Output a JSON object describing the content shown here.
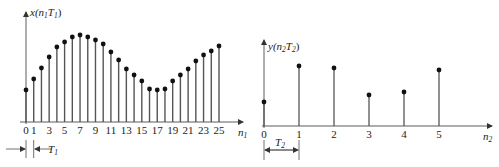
{
  "chart_data": [
    {
      "type": "stem",
      "title": "",
      "ylabel": "x(n1T1)",
      "ylabel_parts": {
        "fn": "x(",
        "var": "n",
        "var_sub": "1",
        "T": "T",
        "T_sub": "1",
        "close": ")"
      },
      "xlabel": "n1",
      "xlabel_parts": {
        "var": "n",
        "sub": "1"
      },
      "x": [
        0,
        1,
        2,
        3,
        4,
        5,
        6,
        7,
        8,
        9,
        10,
        11,
        12,
        13,
        14,
        15,
        16,
        17,
        18,
        19,
        20,
        21,
        22,
        23,
        24,
        25
      ],
      "tick_labels": [
        "0",
        "1",
        "3",
        "5",
        "7",
        "9",
        "11",
        "13",
        "15",
        "17",
        "19",
        "21",
        "23",
        "25"
      ],
      "tick_positions": [
        0,
        1,
        3,
        5,
        7,
        9,
        11,
        13,
        15,
        17,
        19,
        21,
        23,
        25
      ],
      "values_px": [
        32,
        43,
        54,
        65,
        75,
        80,
        85,
        87,
        85,
        82,
        78,
        70,
        62,
        53,
        47,
        41,
        33,
        32,
        33,
        41,
        47,
        53,
        61,
        67,
        71,
        76
      ],
      "values_note": "stem heights in pixels above the axis, measured from the screenshot; no y-axis scale is shown",
      "period_annotation": {
        "label": "T",
        "sub": "1",
        "between": [
          0,
          1
        ]
      },
      "grid": false
    },
    {
      "type": "stem",
      "title": "",
      "ylabel": "y(n2T2)",
      "ylabel_parts": {
        "fn": "y(",
        "var": "n",
        "var_sub": "2",
        "T": "T",
        "T_sub": "2",
        "close": ")"
      },
      "xlabel": "n2",
      "xlabel_parts": {
        "var": "n",
        "sub": "2"
      },
      "x": [
        0,
        1,
        2,
        3,
        4,
        5
      ],
      "tick_labels": [
        "0",
        "1",
        "2",
        "3",
        "4",
        "5"
      ],
      "tick_positions": [
        0,
        1,
        2,
        3,
        4,
        5
      ],
      "values_px": [
        24,
        60,
        58,
        31,
        34,
        56
      ],
      "values_note": "stem heights in pixels above the axis, measured from the screenshot; no y-axis scale is shown",
      "period_annotation": {
        "label": "T",
        "sub": "2",
        "between": [
          0,
          1
        ]
      },
      "grid": false
    }
  ],
  "style": {
    "stem_color": "#555555",
    "dot_color": "#111111",
    "axis_color": "#333333"
  }
}
